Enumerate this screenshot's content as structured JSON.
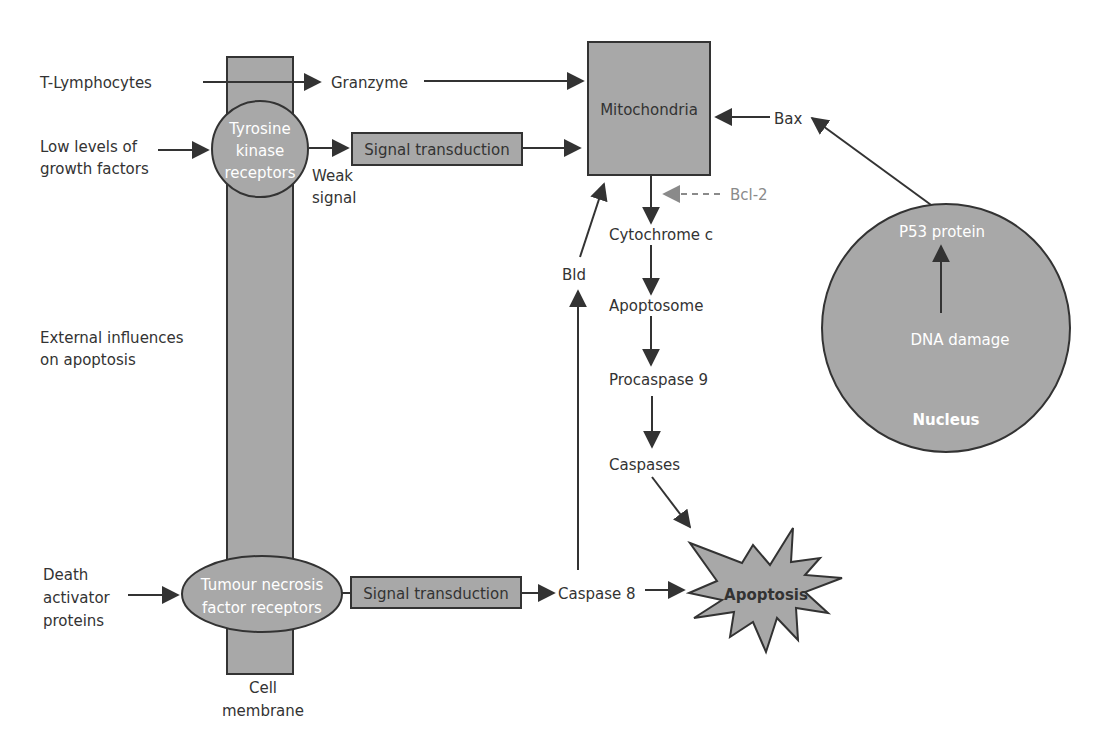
{
  "colors": {
    "fill": "#a8a8a8",
    "stroke": "#333333",
    "text": "#333333",
    "inhibitor": "#8a8a8a",
    "inner_text": "#ffffff"
  },
  "left_labels": {
    "t_lymphocytes": "T-Lymphocytes",
    "growth_factors_1": "Low levels of",
    "growth_factors_2": "growth factors",
    "external_1": "External influences",
    "external_2": "on apoptosis",
    "death_1": "Death",
    "death_2": "activator",
    "death_3": "proteins"
  },
  "membrane": {
    "label_1": "Cell",
    "label_2": "membrane"
  },
  "receptors": {
    "tyrosine_1": "Tyrosine",
    "tyrosine_2": "kinase",
    "tyrosine_3": "receptors",
    "tnf_1": "Tumour necrosis",
    "tnf_2": "factor receptors"
  },
  "nodes": {
    "granzyme": "Granzyme",
    "signal_transduction_top": "Signal transduction",
    "weak_signal_1": "Weak",
    "weak_signal_2": "signal",
    "mitochondria": "Mitochondria",
    "bax": "Bax",
    "bcl2": "Bcl-2",
    "cytochrome_c": "Cytochrome c",
    "bld": "Bld",
    "apoptosome": "Apoptosome",
    "procaspase_9": "Procaspase 9",
    "caspases": "Caspases",
    "signal_transduction_bottom": "Signal transduction",
    "caspase_8": "Caspase 8",
    "apoptosis": "Apoptosis"
  },
  "nucleus": {
    "p53": "P53 protein",
    "dna_damage": "DNA damage",
    "label": "Nucleus"
  }
}
